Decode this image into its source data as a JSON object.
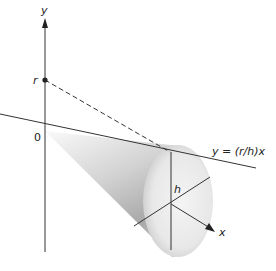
{
  "figure": {
    "labels": {
      "y_axis": "y",
      "x_axis": "x",
      "origin": "0",
      "radius_point": "r",
      "height": "h",
      "line_equation": "y = (r/h)x"
    },
    "colors": {
      "lines": "#333333",
      "cone_light": "#f2f2f2",
      "cone_dark": "#a9a9a9",
      "background": "#ffffff"
    }
  }
}
